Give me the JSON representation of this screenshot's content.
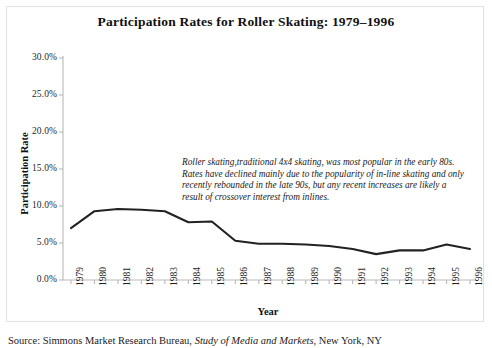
{
  "chart_title": "Participation Rates for Roller Skating: 1979–1996",
  "axis": {
    "ylabel": "Participation Rate",
    "xlabel": "Year",
    "yticks": [
      "0.0%",
      "5.0%",
      "10.0%",
      "15.0%",
      "20.0%",
      "25.0%",
      "30.0%"
    ]
  },
  "annotation": {
    "text": "Roller skating,traditional 4x4 skating, was most popular in the early 80s.  Rates have declined mainly due to the popularity of in-line skating and only recently rebounded in the late 90s, but any recent increases are likely a result of crossover interest from inlines."
  },
  "source": {
    "prefix": "Source:  Simmons Market Research Bureau, ",
    "italic": "Study of Media and Markets",
    "suffix": ", New York, NY"
  },
  "colors": {
    "line": "#222222",
    "axis": "#b9b9b9",
    "frame": "#e2e2e2",
    "text": "#1a1a1a",
    "background": "#ffffff"
  },
  "chart_data": {
    "type": "line",
    "title": "Participation Rates for Roller Skating: 1979–1996",
    "xlabel": "Year",
    "ylabel": "Participation Rate",
    "grid": false,
    "legend": "none",
    "ylim": [
      0,
      30
    ],
    "ytick_values": [
      0,
      5,
      10,
      15,
      20,
      25,
      30
    ],
    "ytick_labels": [
      "0.0%",
      "5.0%",
      "10.0%",
      "15.0%",
      "20.0%",
      "25.0%",
      "30.0%"
    ],
    "categories": [
      "1979",
      "1980",
      "1981",
      "1982",
      "1983",
      "1984",
      "1985",
      "1986",
      "1987",
      "1988",
      "1989",
      "1990",
      "1991",
      "1992",
      "1993",
      "1994",
      "1995",
      "1996"
    ],
    "series": [
      {
        "name": "Roller skating participation rate",
        "values": [
          7.0,
          9.3,
          9.6,
          9.5,
          9.3,
          7.8,
          7.9,
          5.3,
          4.9,
          4.9,
          4.8,
          4.6,
          4.2,
          3.5,
          4.0,
          4.0,
          4.8,
          4.2
        ]
      }
    ]
  }
}
